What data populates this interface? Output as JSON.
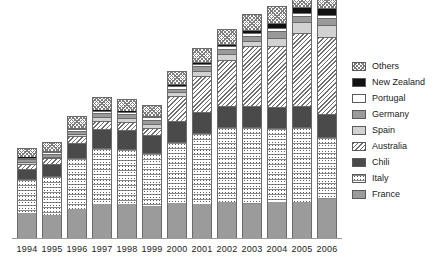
{
  "chart_data": {
    "type": "bar",
    "title": "",
    "subtitle": "",
    "xlabel": "",
    "ylabel": "",
    "stacked": true,
    "grid": false,
    "legend_position": "right",
    "categories": [
      "1994",
      "1995",
      "1996",
      "1997",
      "1998",
      "1999",
      "2000",
      "2001",
      "2002",
      "2003",
      "2004",
      "2005",
      "2006"
    ],
    "ylim": [
      0,
      240
    ],
    "series": [
      {
        "name": "France",
        "pattern": "solid-gray",
        "color": "#9b9b9b",
        "values": [
          26,
          24,
          30,
          36,
          35,
          33,
          37,
          36,
          38,
          36,
          38,
          38,
          41
        ]
      },
      {
        "name": "Italy",
        "pattern": "speckle",
        "color": "#ffffff",
        "values": [
          36,
          41,
          53,
          58,
          58,
          56,
          63,
          74,
          78,
          80,
          77,
          78,
          64
        ]
      },
      {
        "name": "Chili",
        "pattern": "solid-dark",
        "color": "#4a4a4a",
        "values": [
          10,
          12,
          16,
          20,
          20,
          18,
          22,
          22,
          22,
          22,
          22,
          22,
          24
        ]
      },
      {
        "name": "Australia",
        "pattern": "diagonal-hatch",
        "color": "#6f6f6f",
        "values": [
          5,
          6,
          7,
          8,
          8,
          8,
          26,
          37,
          48,
          62,
          63,
          76,
          81
        ]
      },
      {
        "name": "Spain",
        "pattern": "light-gray",
        "color": "#d2d2d2",
        "values": [
          2,
          2,
          3,
          4,
          4,
          4,
          4,
          5,
          6,
          6,
          9,
          11,
          12
        ]
      },
      {
        "name": "Germany",
        "pattern": "medium-gray",
        "color": "#9a9a9a",
        "values": [
          3,
          3,
          3,
          4,
          4,
          4,
          4,
          5,
          5,
          5,
          7,
          7,
          8
        ]
      },
      {
        "name": "Portugal",
        "pattern": "white",
        "color": "#ffffff",
        "values": [
          2,
          2,
          2,
          3,
          3,
          3,
          3,
          3,
          3,
          3,
          3,
          3,
          3
        ]
      },
      {
        "name": "New Zealand",
        "pattern": "solid-black",
        "color": "#111111",
        "values": [
          1,
          1,
          1,
          1,
          1,
          1,
          2,
          2,
          2,
          3,
          5,
          6,
          7
        ]
      },
      {
        "name": "Others",
        "pattern": "crosshatch",
        "color": "#7d7d7d",
        "values": [
          9,
          9,
          12,
          13,
          12,
          12,
          13,
          14,
          16,
          17,
          18,
          22,
          25
        ]
      }
    ]
  },
  "legend": {
    "items": [
      {
        "label": "Others",
        "pattern": "crosshatch"
      },
      {
        "label": "New Zealand",
        "pattern": "solid-black"
      },
      {
        "label": "Portugal",
        "pattern": "white"
      },
      {
        "label": "Germany",
        "pattern": "medium-gray"
      },
      {
        "label": "Spain",
        "pattern": "light-gray"
      },
      {
        "label": "Australia",
        "pattern": "diagonal-hatch"
      },
      {
        "label": "Chili",
        "pattern": "solid-dark"
      },
      {
        "label": "Italy",
        "pattern": "speckle"
      },
      {
        "label": "France",
        "pattern": "solid-gray"
      }
    ]
  }
}
